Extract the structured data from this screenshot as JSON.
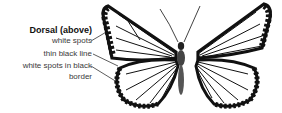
{
  "diagram": {
    "view_title": "Dorsal (above)",
    "callouts": [
      {
        "text": "white spots"
      },
      {
        "text": "thin black line"
      },
      {
        "text": "white spots in black",
        "text_line2": "border"
      }
    ],
    "colors": {
      "ink": "#111111",
      "label": "#3a3a3a",
      "background": "#ffffff"
    }
  }
}
